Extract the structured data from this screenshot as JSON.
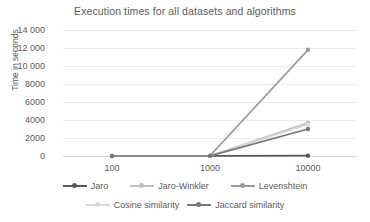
{
  "chart_data": {
    "type": "line",
    "title": "Execution times for all datasets and algorithms",
    "xlabel": "",
    "ylabel": "Time in seconds",
    "categories": [
      "100",
      "1000",
      "10000"
    ],
    "x_tick_labels": [
      "100",
      "1000",
      "10000"
    ],
    "y_tick_labels": [
      "0",
      "2000",
      "4000",
      "6000",
      "8000",
      "10 000",
      "12 000",
      "14 000"
    ],
    "y_tick_values": [
      0,
      2000,
      4000,
      6000,
      8000,
      10000,
      12000,
      14000
    ],
    "ylim": [
      0,
      14000
    ],
    "grid": true,
    "legend_position": "bottom",
    "series": [
      {
        "name": "Jaro",
        "color": "#595959",
        "values": [
          2,
          10,
          40
        ]
      },
      {
        "name": "Jaro-Winkler",
        "color": "#bfbfbf",
        "values": [
          2,
          12,
          3700
        ]
      },
      {
        "name": "Levenshtein",
        "color": "#9a9a9a",
        "values": [
          3,
          25,
          11800
        ]
      },
      {
        "name": "Cosine similarity",
        "color": "#d9d9d9",
        "values": [
          2,
          10,
          3500
        ]
      },
      {
        "name": "Jaccard similarity",
        "color": "#767676",
        "values": [
          2,
          15,
          3000
        ]
      }
    ]
  },
  "legend": {
    "rows": [
      [
        "Jaro",
        "Jaro-Winkler",
        "Levenshtein"
      ],
      [
        "Cosine similarity",
        "Jaccard similarity"
      ]
    ]
  }
}
